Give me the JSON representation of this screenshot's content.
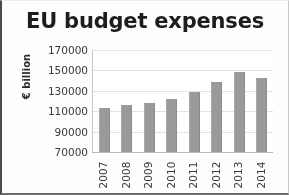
{
  "chart_data": {
    "type": "bar",
    "title": "EU budget expenses",
    "xlabel": "",
    "ylabel": "€ billion",
    "categories": [
      "2007",
      "2008",
      "2009",
      "2010",
      "2011",
      "2012",
      "2013",
      "2014"
    ],
    "values": [
      113500,
      116500,
      118000,
      122000,
      129000,
      138500,
      148000,
      143000
    ],
    "series": [
      {
        "name": "EU budget expenses",
        "values": [
          113500,
          116500,
          118000,
          122000,
          129000,
          138500,
          148000,
          143000
        ]
      }
    ],
    "ylim": [
      70000,
      170000
    ],
    "ytick_labels": [
      "170000",
      "150000",
      "130000",
      "110000",
      "90000",
      "70000"
    ],
    "ytick_values": [
      170000,
      150000,
      130000,
      110000,
      90000,
      70000
    ],
    "grid": true,
    "legend": false,
    "legend_position": "none",
    "bar_color": "#9a9a9a",
    "gridline_color": "#e3e3e3",
    "axis_color": "#b9b9b9",
    "title_color": "#1d1d1d",
    "background_color": "#ffffff"
  }
}
